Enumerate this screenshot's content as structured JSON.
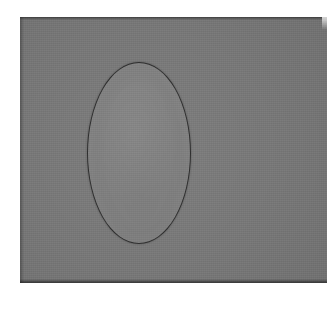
{
  "image": {
    "kind": "grayscale-photograph",
    "subject": "ellipse inclusion on a uniform gray plate",
    "caption": "",
    "page_background": "#ffffff",
    "width_px": 327,
    "height_px": 309
  },
  "plate": {
    "name": "gray background plate",
    "fill_color": "#787878",
    "edge_color": "#2e2e2e",
    "left_px": 20,
    "top_px": 17,
    "width_px": 307,
    "height_px": 266,
    "bleeds_off_right_edge": true,
    "texture": "fine scan grain"
  },
  "ellipse": {
    "name": "ellipse inclusion",
    "fill_color": "#828282",
    "outline_color": "#2e2e2e",
    "outline_width_px": 1.6,
    "center_x_px": 139,
    "center_y_px": 153,
    "radius_x_px": 51,
    "radius_y_px": 90,
    "orientation": "vertical major axis",
    "contrast_vs_background": "slightly brighter"
  },
  "corner_highlight": {
    "name": "page corner highlight",
    "color": "#ffffff",
    "position": "top-right"
  }
}
